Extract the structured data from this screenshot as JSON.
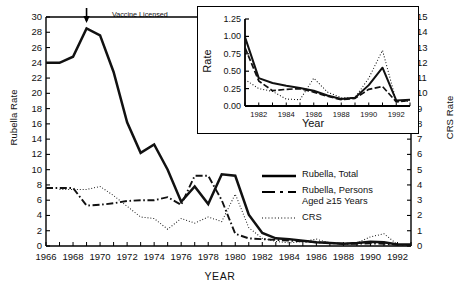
{
  "chart_data": {
    "type": "line",
    "title": "",
    "xlabel": "YEAR",
    "ylabel": "Rubella Rate",
    "y2label": "CRS Rate",
    "xlim": [
      1966,
      1993
    ],
    "ylim": [
      0,
      30
    ],
    "y2lim": [
      0,
      15
    ],
    "grid": false,
    "legend_position": "right-center",
    "x_ticks": [
      1966,
      1968,
      1970,
      1972,
      1974,
      1976,
      1978,
      1980,
      1982,
      1984,
      1986,
      1988,
      1990,
      1992
    ],
    "y_ticks": [
      0,
      2,
      4,
      6,
      8,
      10,
      12,
      14,
      16,
      18,
      20,
      22,
      24,
      26,
      28,
      30
    ],
    "y2_ticks": [
      0,
      1,
      2,
      3,
      4,
      5,
      6,
      7,
      8,
      9,
      10,
      11,
      12,
      13,
      14,
      15
    ],
    "annotations": [
      {
        "text": "Vaccine Licensed",
        "x": 1969,
        "y": 30,
        "arrow": "down"
      }
    ],
    "x": [
      1966,
      1967,
      1968,
      1969,
      1970,
      1971,
      1972,
      1973,
      1974,
      1975,
      1976,
      1977,
      1978,
      1979,
      1980,
      1981,
      1982,
      1983,
      1984,
      1985,
      1986,
      1987,
      1988,
      1989,
      1990,
      1991,
      1992,
      1993
    ],
    "series": [
      {
        "name": "Rubella, Total",
        "style": "solid",
        "axis": "left",
        "values": [
          24.0,
          24.0,
          24.8,
          28.5,
          27.6,
          22.8,
          16.2,
          12.2,
          13.3,
          10.0,
          5.8,
          7.8,
          5.5,
          9.4,
          9.2,
          4.1,
          1.7,
          1.0,
          0.9,
          0.7,
          0.5,
          0.4,
          0.3,
          0.4,
          0.55,
          0.5,
          0.2,
          0.2
        ]
      },
      {
        "name": "Rubella, Persons Aged ≥15 Years",
        "style": "dash-dot",
        "axis": "left",
        "values": [
          7.6,
          7.6,
          7.6,
          5.3,
          5.4,
          5.6,
          5.9,
          6.0,
          6.0,
          6.4,
          5.4,
          9.2,
          9.2,
          6.0,
          1.6,
          1.0,
          0.9,
          0.8,
          0.7,
          0.6,
          0.5,
          0.4,
          0.3,
          0.3,
          0.35,
          0.3,
          0.15,
          0.15
        ]
      },
      {
        "name": "CRS",
        "style": "dotted",
        "axis": "right",
        "values": [
          null,
          3.7,
          3.7,
          3.7,
          3.9,
          3.3,
          2.6,
          1.9,
          1.8,
          1.1,
          1.8,
          1.5,
          1.9,
          1.6,
          3.4,
          1.2,
          0.5,
          0.3,
          0.2,
          0.3,
          0.45,
          0.2,
          0.12,
          0.2,
          0.6,
          0.8,
          0.1,
          0.1
        ]
      }
    ],
    "inset": {
      "type": "line",
      "xlabel": "Year",
      "ylabel": "Rate",
      "xlim": [
        1981,
        1993
      ],
      "ylim": [
        0,
        1.25
      ],
      "x_ticks": [
        1982,
        1984,
        1986,
        1988,
        1990,
        1992
      ],
      "y_ticks": [
        "0.00",
        "0.25",
        "0.50",
        "0.75",
        "1.00",
        "1.25"
      ],
      "x": [
        1981,
        1982,
        1983,
        1984,
        1985,
        1986,
        1987,
        1988,
        1989,
        1990,
        1991,
        1992,
        1993
      ],
      "series": [
        {
          "name": "Rubella, Total",
          "style": "solid",
          "values": [
            0.99,
            0.4,
            0.33,
            0.29,
            0.26,
            0.22,
            0.15,
            0.1,
            0.12,
            0.3,
            0.55,
            0.08,
            0.09
          ]
        },
        {
          "name": "Rubella, Persons Aged ≥15 Years",
          "style": "dash-dot",
          "values": [
            0.84,
            0.36,
            0.22,
            0.24,
            0.25,
            0.2,
            0.14,
            0.09,
            0.11,
            0.24,
            0.28,
            0.06,
            0.08
          ]
        },
        {
          "name": "CRS",
          "style": "dotted",
          "values": [
            0.38,
            0.25,
            0.21,
            0.1,
            0.09,
            0.4,
            0.2,
            0.12,
            0.12,
            0.4,
            0.8,
            0.07,
            0.07
          ]
        }
      ]
    }
  },
  "labels": {
    "y_axis_title": "Rubella Rate",
    "y2_axis_title": "CRS Rate",
    "x_axis_title": "YEAR",
    "annotation_vaccine": "Vaccine Licensed",
    "inset_y_title": "Rate",
    "inset_x_title": "Year"
  },
  "legend": {
    "items": [
      {
        "label": "Rubella, Total",
        "style": "solid"
      },
      {
        "label": "Rubella, Persons",
        "label2": "Aged ≥15 Years",
        "style": "dash-dot"
      },
      {
        "label": "CRS",
        "style": "dotted"
      }
    ]
  },
  "colors": {
    "line": "#111111",
    "axis": "#000000",
    "background": "#ffffff"
  }
}
